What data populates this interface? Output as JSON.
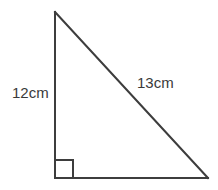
{
  "figure": {
    "name": "right-triangle-diagram",
    "background_color": "#ffffff",
    "stroke_color": "#3d3d3d",
    "text_color": "#3a3a3a",
    "stroke_width": 2,
    "labels": {
      "vertical_leg": "12cm",
      "hypotenuse": "13cm"
    },
    "geometry": {
      "apex": [
        55,
        12
      ],
      "right_angle_vertex": [
        55,
        178
      ],
      "base_end": [
        208,
        178
      ],
      "right_angle_marker": {
        "size": 18,
        "x": 55,
        "y": 160
      }
    }
  }
}
